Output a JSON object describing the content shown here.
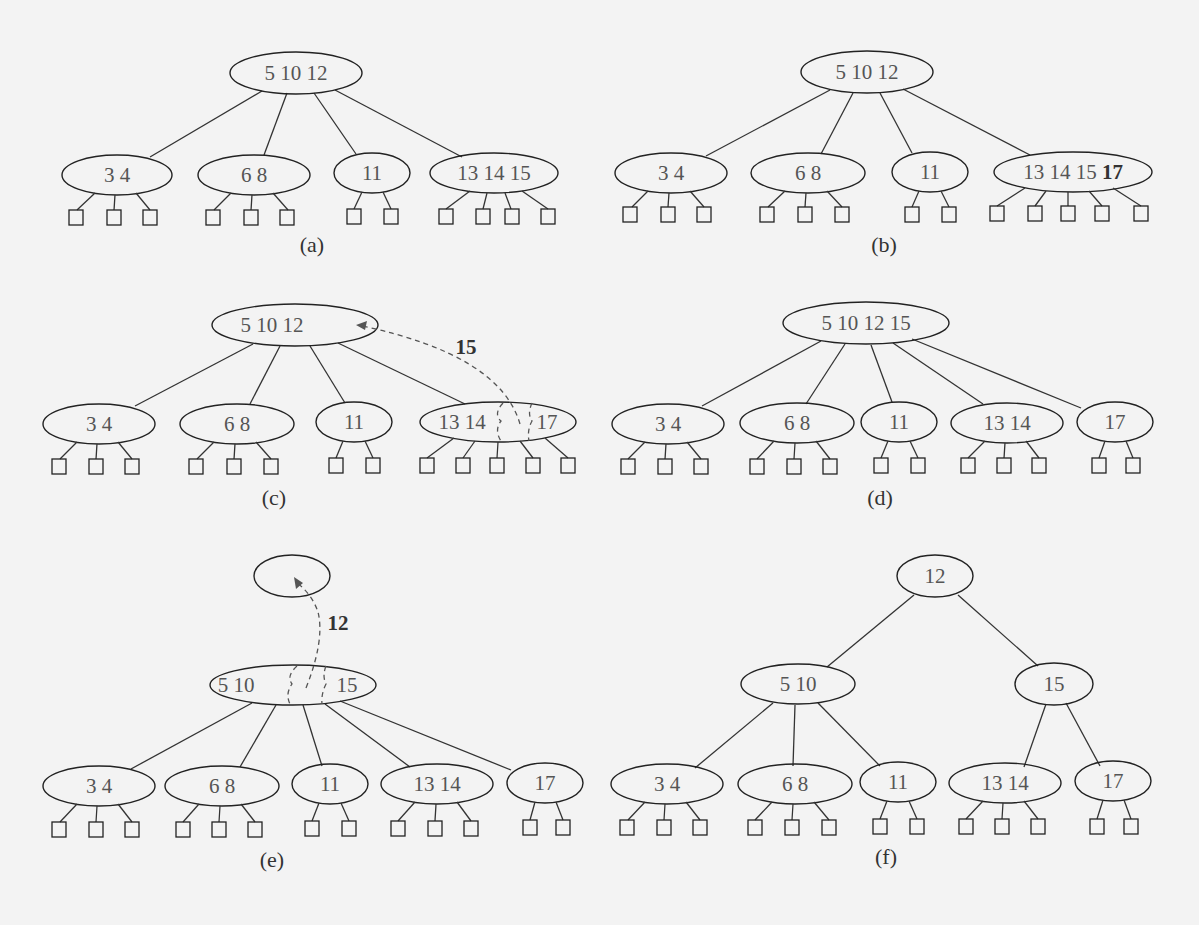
{
  "figure": {
    "panels": [
      {
        "id": "a",
        "label": "(a)",
        "root": {
          "keys": [
            "5",
            "10",
            "12"
          ]
        },
        "children": [
          {
            "keys": [
              "3",
              "4"
            ],
            "leaves": 3
          },
          {
            "keys": [
              "6",
              "8"
            ],
            "leaves": 3
          },
          {
            "keys": [
              "11"
            ],
            "leaves": 2
          },
          {
            "keys": [
              "13",
              "14",
              "15"
            ],
            "leaves": 4
          }
        ]
      },
      {
        "id": "b",
        "label": "(b)",
        "root": {
          "keys": [
            "5",
            "10",
            "12"
          ]
        },
        "children": [
          {
            "keys": [
              "3",
              "4"
            ],
            "leaves": 3
          },
          {
            "keys": [
              "6",
              "8"
            ],
            "leaves": 3
          },
          {
            "keys": [
              "11"
            ],
            "leaves": 2
          },
          {
            "keys": [
              "13",
              "14",
              "15"
            ],
            "highlight_key": "17",
            "leaves": 5
          }
        ]
      },
      {
        "id": "c",
        "label": "(c)",
        "root": {
          "keys": [
            "5",
            "10",
            "12"
          ]
        },
        "children": [
          {
            "keys": [
              "3",
              "4"
            ],
            "leaves": 3
          },
          {
            "keys": [
              "6",
              "8"
            ],
            "leaves": 3
          },
          {
            "keys": [
              "11"
            ],
            "leaves": 2
          },
          {
            "keys_left": [
              "13",
              "14"
            ],
            "keys_right": [
              "17"
            ],
            "leaves": 5
          }
        ],
        "moving_key": "15"
      },
      {
        "id": "d",
        "label": "(d)",
        "root": {
          "keys": [
            "5",
            "10",
            "12",
            "15"
          ]
        },
        "children": [
          {
            "keys": [
              "3",
              "4"
            ],
            "leaves": 3
          },
          {
            "keys": [
              "6",
              "8"
            ],
            "leaves": 3
          },
          {
            "keys": [
              "11"
            ],
            "leaves": 2
          },
          {
            "keys": [
              "13",
              "14"
            ],
            "leaves": 3
          },
          {
            "keys": [
              "17"
            ],
            "leaves": 2
          }
        ]
      },
      {
        "id": "e",
        "label": "(e)",
        "new_root": {
          "keys": []
        },
        "root": {
          "keys_left": [
            "5",
            "10"
          ],
          "keys_right": [
            "15"
          ]
        },
        "children": [
          {
            "keys": [
              "3",
              "4"
            ],
            "leaves": 3
          },
          {
            "keys": [
              "6",
              "8"
            ],
            "leaves": 3
          },
          {
            "keys": [
              "11"
            ],
            "leaves": 2
          },
          {
            "keys": [
              "13",
              "14"
            ],
            "leaves": 3
          },
          {
            "keys": [
              "17"
            ],
            "leaves": 2
          }
        ],
        "moving_key": "12"
      },
      {
        "id": "f",
        "label": "(f)",
        "root": {
          "keys": [
            "12"
          ]
        },
        "internal": [
          {
            "keys": [
              "5",
              "10"
            ]
          },
          {
            "keys": [
              "15"
            ]
          }
        ],
        "children": [
          {
            "keys": [
              "3",
              "4"
            ],
            "leaves": 3
          },
          {
            "keys": [
              "6",
              "8"
            ],
            "leaves": 3
          },
          {
            "keys": [
              "11"
            ],
            "leaves": 2
          },
          {
            "keys": [
              "13",
              "14"
            ],
            "leaves": 3
          },
          {
            "keys": [
              "17"
            ],
            "leaves": 2
          }
        ]
      }
    ]
  },
  "text": {
    "a_label": "(a)",
    "b_label": "(b)",
    "c_label": "(c)",
    "d_label": "(d)",
    "e_label": "(e)",
    "f_label": "(f)",
    "a_root": "5  10  12",
    "b_root": "5  10  12",
    "c_root": "5  10  12",
    "d_root": "5  10  12  15",
    "f_root": "12",
    "n_3_4": "3    4",
    "n_6_8": "6    8",
    "n_11": "11",
    "n_13_14_15": "13 14 15",
    "n_13_14_15_pre": "13 14 15 ",
    "n_17_bold": "17",
    "c_13_14": "13 14",
    "c_17": "17",
    "c_move": "15",
    "n_13_14": "13  14",
    "n_17": "17",
    "e_5_10": "5   10",
    "e_15": "15",
    "e_move": "12",
    "f_5_10": "5   10",
    "f_15": "15"
  }
}
